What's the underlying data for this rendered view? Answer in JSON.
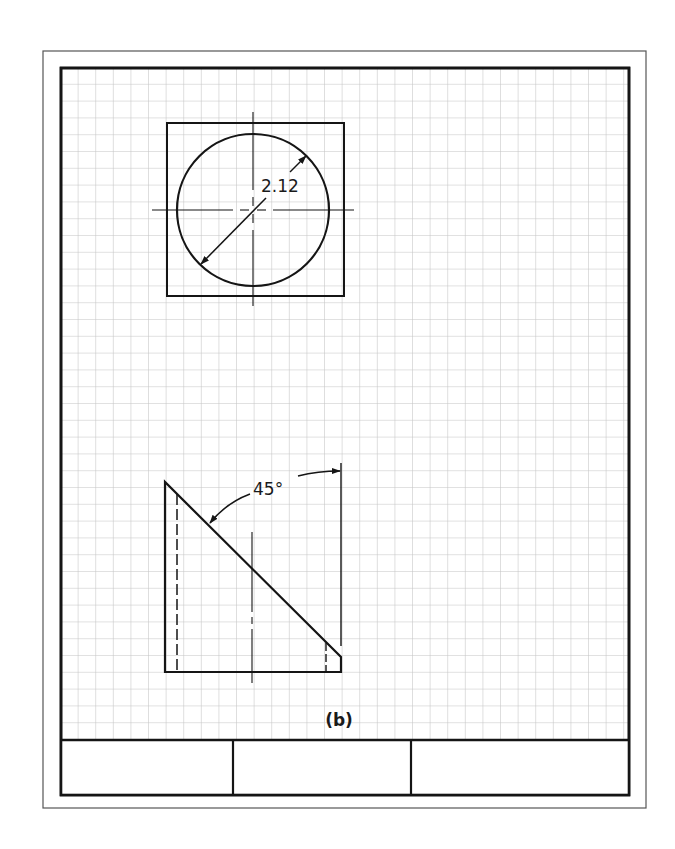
{
  "sheet": {
    "label": "(b)",
    "grid": {
      "spacing_x": 17.6,
      "spacing_y": 16.8,
      "color": "#c4c4c4"
    },
    "colors": {
      "line": "#151515",
      "paper": "#ffffff"
    }
  },
  "top_view": {
    "shape": "square with inscribed circle",
    "dimension_label": "2.12",
    "dimension_type": "diameter"
  },
  "front_view": {
    "shape": "right triangle with chamfered tip and hidden lines",
    "angle_label": "45°"
  },
  "title_block": {
    "cells": [
      "",
      "",
      ""
    ]
  }
}
